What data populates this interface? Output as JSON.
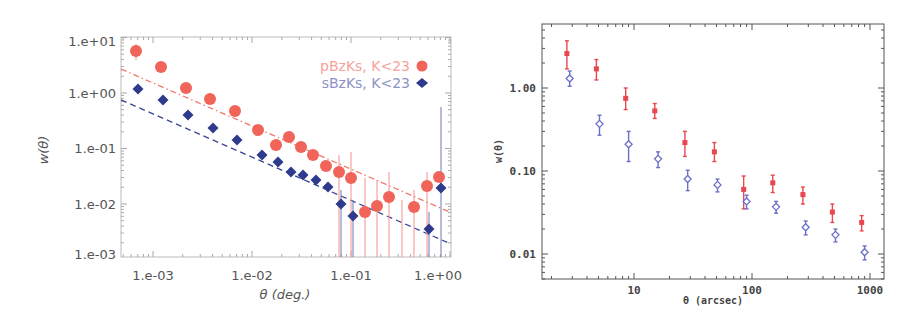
{
  "chart_data": [
    {
      "type": "scatter",
      "title": "",
      "xlabel": "θ (deg.)",
      "ylabel": "w(θ)",
      "xscale": "log",
      "yscale": "log",
      "xlim": [
        0.0005,
        1.1
      ],
      "ylim": [
        0.001,
        12
      ],
      "grid": false,
      "legend_position": "upper right",
      "x_tick_labels": [
        "1.e-03",
        "1.e-02",
        "1.e-01",
        "1.e+00"
      ],
      "y_tick_labels": [
        "1.e+01",
        "1.e+00",
        "1.e-01",
        "1.e-02",
        "1.e-03"
      ],
      "series": [
        {
          "name": "pBzKs, K<23",
          "marker": "circle",
          "color": "#f0645a",
          "x": [
            0.00065,
            0.0013,
            0.0027,
            0.0054,
            0.011,
            0.022,
            0.033,
            0.045,
            0.065,
            0.09,
            0.12,
            0.16,
            0.23,
            0.33,
            0.47,
            0.66,
            0.94,
            1.3,
            1.85
          ],
          "values": [
            5.8,
            2.9,
            1.15,
            0.75,
            0.45,
            0.21,
            0.11,
            0.15,
            0.1,
            0.072,
            0.048,
            0.038,
            0.028,
            0.0075,
            0.0085,
            0.0125,
            0.0085,
            0.021,
            0.03
          ],
          "fit_line": {
            "style": "dash-dot",
            "x": [
              0.0005,
              1.1
            ],
            "y": [
              2.7,
              0.007
            ]
          }
        },
        {
          "name": "sBzKs, K<23",
          "marker": "diamond",
          "color": "#2e3a8c",
          "x": [
            0.00065,
            0.0013,
            0.0027,
            0.0054,
            0.011,
            0.022,
            0.033,
            0.045,
            0.065,
            0.09,
            0.12,
            0.16,
            0.23,
            0.33,
            0.47,
            0.66,
            0.94,
            1.3,
            1.85
          ],
          "values": [
            1.1,
            0.7,
            0.38,
            0.23,
            0.14,
            0.075,
            0.055,
            0.036,
            0.032,
            0.027,
            0.02,
            0.01,
            0.0058,
            0.0035,
            0.02
          ],
          "fit_line": {
            "style": "dashed",
            "x": [
              0.0005,
              1.1
            ],
            "y": [
              0.75,
              0.0019
            ]
          }
        }
      ]
    },
    {
      "type": "scatter",
      "title": "",
      "xlabel": "θ (arcsec)",
      "ylabel": "w(θ)",
      "xscale": "log",
      "yscale": "log",
      "xlim": [
        2,
        1100
      ],
      "ylim": [
        0.005,
        5.5
      ],
      "grid": false,
      "x_tick_labels": [
        "10",
        "100",
        "1000"
      ],
      "y_tick_labels": [
        "1.00",
        "0.10",
        "0.01"
      ],
      "series": [
        {
          "name": "red",
          "marker": "filled-star-errorbar",
          "color": "#e8474f",
          "x": [
            2.7,
            4.8,
            8.5,
            15,
            27,
            48,
            85,
            150,
            270,
            480,
            850
          ],
          "values": [
            2.6,
            1.7,
            0.75,
            0.53,
            0.22,
            0.17,
            0.06,
            0.072,
            0.052,
            0.032,
            0.024
          ],
          "err_low": [
            0.9,
            0.45,
            0.2,
            0.1,
            0.07,
            0.04,
            0.025,
            0.017,
            0.012,
            0.008,
            0.005
          ],
          "err_high": [
            1.1,
            0.5,
            0.25,
            0.12,
            0.08,
            0.05,
            0.027,
            0.017,
            0.012,
            0.008,
            0.005
          ]
        },
        {
          "name": "blue",
          "marker": "open-diamond-errorbar",
          "color": "#6a70c8",
          "x": [
            2.85,
            5.1,
            9,
            16,
            28.5,
            51,
            90,
            160,
            285,
            510,
            900
          ],
          "values": [
            1.3,
            0.37,
            0.21,
            0.14,
            0.08,
            0.068,
            0.043,
            0.037,
            0.021,
            0.017,
            0.0105
          ],
          "err_low": [
            0.25,
            0.1,
            0.08,
            0.03,
            0.022,
            0.012,
            0.008,
            0.006,
            0.004,
            0.003,
            0.002
          ],
          "err_high": [
            0.3,
            0.1,
            0.09,
            0.03,
            0.022,
            0.012,
            0.008,
            0.006,
            0.004,
            0.003,
            0.002
          ]
        }
      ]
    }
  ],
  "left_chart": {
    "ylabel": "w(θ)",
    "xlabel": "θ (deg.)",
    "y_ticks": [
      "1.e+01",
      "1.e+00",
      "1.e-01",
      "1.e-02",
      "1.e-03"
    ],
    "x_ticks": [
      "1.e-03",
      "1.e-02",
      "1.e-01",
      "1.e+00"
    ],
    "legend": [
      {
        "label": "pBzKs, K<23",
        "color": "#f0645a"
      },
      {
        "label": "sBzKs, K<23",
        "color": "#2e3a8c"
      }
    ]
  },
  "right_chart": {
    "ylabel": "w(θ)",
    "xlabel": "θ (arcsec)",
    "y_ticks": [
      "1.00",
      "0.10",
      "0.01"
    ],
    "x_ticks": [
      "10",
      "100",
      "1000"
    ]
  }
}
